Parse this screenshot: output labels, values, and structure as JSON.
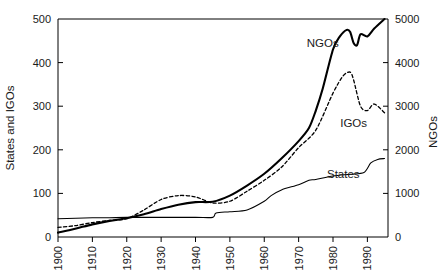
{
  "chart_data": {
    "type": "line",
    "title": "",
    "xlabel": "",
    "ylabel": "States and IGOs",
    "y2label": "NGOs",
    "xlim": [
      1900,
      1996
    ],
    "ylim": [
      0,
      500
    ],
    "y2lim": [
      0,
      5000
    ],
    "grid": false,
    "legend_position": "inline-annotations",
    "x_ticks": [
      "1900",
      "1910",
      "1920",
      "1930",
      "1940",
      "1950",
      "1960",
      "1970",
      "1980",
      "1990"
    ],
    "x_tick_values": [
      1900,
      1910,
      1920,
      1930,
      1940,
      1950,
      1960,
      1970,
      1980,
      1990
    ],
    "y_ticks": [
      "0",
      "100",
      "200",
      "300",
      "400",
      "500"
    ],
    "y_tick_values": [
      0,
      100,
      200,
      300,
      400,
      500
    ],
    "y2_ticks": [
      "0",
      "1000",
      "2000",
      "3000",
      "4000",
      "5000"
    ],
    "y2_tick_values": [
      0,
      1000,
      2000,
      3000,
      4000,
      5000
    ],
    "series": [
      {
        "name": "States",
        "axis": "left",
        "style": "solid-thin",
        "color": "#000000",
        "x": [
          1900,
          1910,
          1915,
          1920,
          1930,
          1940,
          1945,
          1946,
          1950,
          1955,
          1960,
          1962,
          1965,
          1970,
          1973,
          1975,
          1980,
          1985,
          1989,
          1991,
          1993,
          1995
        ],
        "values": [
          42,
          44,
          44,
          45,
          45,
          45,
          45,
          55,
          58,
          62,
          82,
          95,
          108,
          120,
          130,
          132,
          140,
          144,
          148,
          170,
          178,
          180
        ]
      },
      {
        "name": "IGOs",
        "axis": "left",
        "style": "dashed",
        "color": "#000000",
        "x": [
          1900,
          1905,
          1910,
          1915,
          1920,
          1925,
          1930,
          1935,
          1940,
          1945,
          1950,
          1955,
          1960,
          1965,
          1970,
          1975,
          1980,
          1983,
          1985,
          1986,
          1988,
          1990,
          1992,
          1995
        ],
        "values": [
          22,
          26,
          33,
          38,
          42,
          62,
          86,
          95,
          92,
          78,
          82,
          105,
          130,
          160,
          205,
          245,
          330,
          370,
          378,
          360,
          300,
          290,
          305,
          285
        ]
      },
      {
        "name": "NGOs",
        "axis": "right",
        "style": "solid-bold",
        "color": "#000000",
        "x": [
          1900,
          1905,
          1910,
          1915,
          1920,
          1925,
          1930,
          1935,
          1940,
          1945,
          1950,
          1955,
          1960,
          1965,
          1970,
          1973,
          1975,
          1977,
          1980,
          1982,
          1984,
          1985,
          1986,
          1987,
          1988,
          1990,
          1992,
          1995
        ],
        "values": [
          100,
          190,
          290,
          370,
          430,
          520,
          640,
          740,
          800,
          810,
          950,
          1180,
          1450,
          1800,
          2200,
          2500,
          2900,
          3400,
          4300,
          4600,
          4750,
          4700,
          4450,
          4400,
          4650,
          4600,
          4780,
          5000
        ]
      }
    ],
    "annotations": [
      {
        "text": "NGOs",
        "x": 1977,
        "y_axis": "right",
        "y": 4350
      },
      {
        "text": "IGOs",
        "x": 1986,
        "y_axis": "left",
        "y": 252
      },
      {
        "text": "States",
        "x": 1983,
        "y_axis": "left",
        "y": 135
      }
    ]
  },
  "axes": {
    "left_title": "States and IGOs",
    "right_title": "NGOs"
  }
}
